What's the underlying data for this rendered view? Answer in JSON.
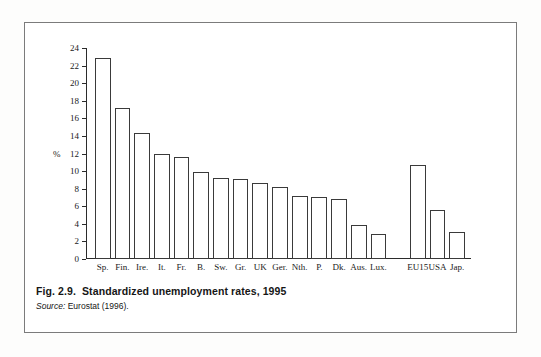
{
  "figure": {
    "number_label": "Fig. 2.9.",
    "title": "Standardized unemployment rates, 1995",
    "source_label": "Source:",
    "source_text": "Eurostat (1996)."
  },
  "axis": {
    "y_unit_label": "%",
    "y_ticks": [
      0,
      2,
      4,
      6,
      8,
      10,
      12,
      14,
      16,
      18,
      20,
      22,
      24
    ]
  },
  "chart_data": {
    "type": "bar",
    "title": "Standardized unemployment rates, 1995",
    "xlabel": "",
    "ylabel": "%",
    "ylim": [
      0,
      24
    ],
    "ytick_step": 2,
    "grid": false,
    "legend": "none",
    "bar_style": {
      "fill": "#ffffff",
      "edge": "#3a3a3a"
    },
    "group_gap_after": "Lux.",
    "categories": [
      "Sp.",
      "Fin.",
      "Ire.",
      "It.",
      "Fr.",
      "B.",
      "Sw.",
      "Gr.",
      "UK",
      "Ger.",
      "Nth.",
      "P.",
      "Dk.",
      "Aus.",
      "Lux.",
      "EU15",
      "USA",
      "Jap."
    ],
    "values": [
      22.9,
      17.2,
      14.3,
      11.9,
      11.6,
      9.9,
      9.2,
      9.1,
      8.7,
      8.2,
      7.2,
      7.1,
      6.8,
      3.9,
      2.9,
      10.7,
      5.6,
      3.1
    ]
  }
}
